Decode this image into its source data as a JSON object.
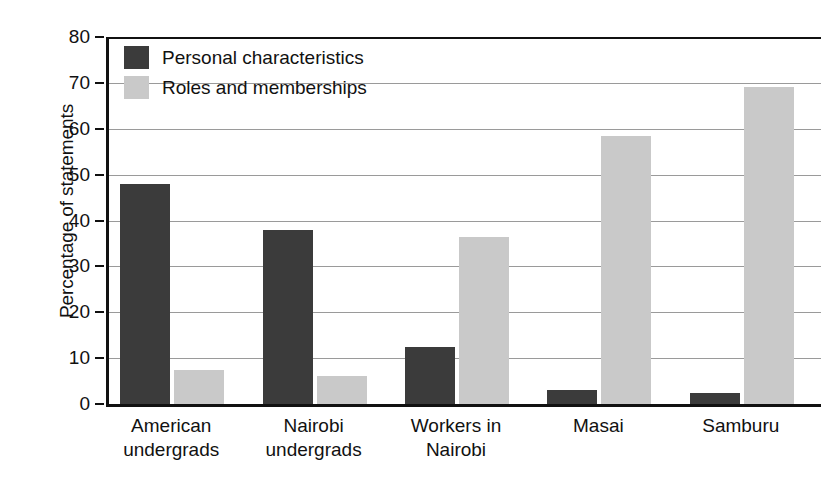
{
  "chart_data": {
    "type": "bar",
    "title": "",
    "xlabel": "",
    "ylabel": "Percentage of statements",
    "ylim": [
      0,
      80
    ],
    "yticks": [
      0,
      10,
      20,
      30,
      40,
      50,
      60,
      70,
      80
    ],
    "ytick_labels": [
      "0",
      "10",
      "20",
      "30",
      "40",
      "50",
      "60",
      "70",
      "80"
    ],
    "grid": "horizontal",
    "legend_position": "upper-left-inside",
    "categories": [
      "American undergrads",
      "Nairobi undergrads",
      "Workers in Nairobi",
      "Masai",
      "Samburu"
    ],
    "category_lines": [
      [
        "American",
        "undergrads"
      ],
      [
        "Nairobi",
        "undergrads"
      ],
      [
        "Workers in",
        "Nairobi"
      ],
      [
        "Masai",
        ""
      ],
      [
        "Samburu",
        ""
      ]
    ],
    "series": [
      {
        "name": "Personal characteristics",
        "color": "#3b3b3b",
        "values": [
          48,
          38,
          12.5,
          3,
          2.5
        ]
      },
      {
        "name": "Roles and memberships",
        "color": "#c9c9c9",
        "values": [
          7.5,
          6,
          36.5,
          58.5,
          69
        ]
      }
    ]
  },
  "legend": {
    "items": [
      {
        "label": "Personal characteristics",
        "color": "#3b3b3b"
      },
      {
        "label": "Roles and memberships",
        "color": "#c9c9c9"
      }
    ]
  },
  "axis": {
    "y_title": "Percentage of statements"
  }
}
